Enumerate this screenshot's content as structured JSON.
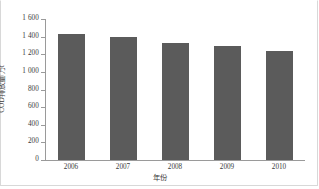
{
  "chart_data": {
    "type": "bar",
    "title": "",
    "xlabel": "年份",
    "ylabel": "COD排放量/万t",
    "categories": [
      "2006",
      "2007",
      "2008",
      "2009",
      "2010"
    ],
    "values": [
      1430,
      1395,
      1330,
      1295,
      1240
    ],
    "ylim": [
      0,
      1600
    ],
    "ytick_step": 200,
    "ytick_labels": [
      "1 600",
      "1 400",
      "1 200",
      "1 000",
      "800",
      "600",
      "400",
      "200",
      "0"
    ],
    "ytick_values": [
      1600,
      1400,
      1200,
      1000,
      800,
      600,
      400,
      200,
      0
    ],
    "grid": false,
    "legend": "none",
    "series": [
      {
        "name": "COD排放量",
        "values": [
          1430,
          1395,
          1330,
          1295,
          1240
        ]
      }
    ],
    "colors": {
      "bar_fill": "#5b5b5b",
      "axis": "#9a9a9a",
      "text": "#3a3a3a",
      "background": "#ffffff",
      "frame": "#d8d8d8"
    }
  }
}
